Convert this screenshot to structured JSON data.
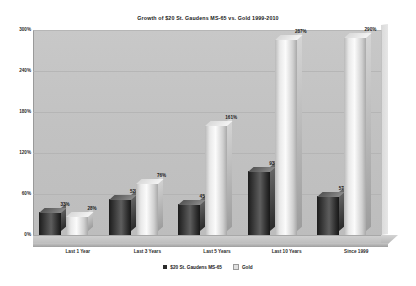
{
  "chart_data": {
    "type": "bar",
    "title": "Growth of $20 St. Gaudens MS-65  vs.  Gold 1999-2010",
    "xlabel": "",
    "ylabel": "",
    "ylim": [
      0,
      300
    ],
    "ytick_labels": [
      "300%",
      "240%",
      "180%",
      "120%",
      "60%",
      "0%"
    ],
    "ytick_values": [
      300,
      240,
      180,
      120,
      60,
      0
    ],
    "grid": true,
    "legend_position": "bottom",
    "categories": [
      "Last 1 Year",
      "Last 3 Years",
      "Last 5 Years",
      "Last 10 Years",
      "Since 1999"
    ],
    "series": [
      {
        "name": "$20 St. Gaudens MS-65",
        "color": "#2b2b2b",
        "values": [
          33,
          52,
          45,
          93,
          57
        ],
        "labels": [
          "33%",
          "52%",
          "45%",
          "93%",
          "57%"
        ]
      },
      {
        "name": "Gold",
        "color": "#e0e0e0",
        "values": [
          28,
          76,
          161,
          287,
          290
        ],
        "labels": [
          "28%",
          "76%",
          "161%",
          "287%",
          "290%"
        ]
      }
    ]
  },
  "legend": {
    "items": [
      {
        "label": "$20 St. Gaudens MS-65",
        "swatch": "#2b2b2b"
      },
      {
        "label": "Gold",
        "swatch": "#e0e0e0"
      }
    ]
  },
  "colors": {
    "plot_background": "#c3c3c3",
    "page_background": "#ffffff",
    "gridline": "#b0b0b0",
    "text": "#1a1a1a"
  }
}
